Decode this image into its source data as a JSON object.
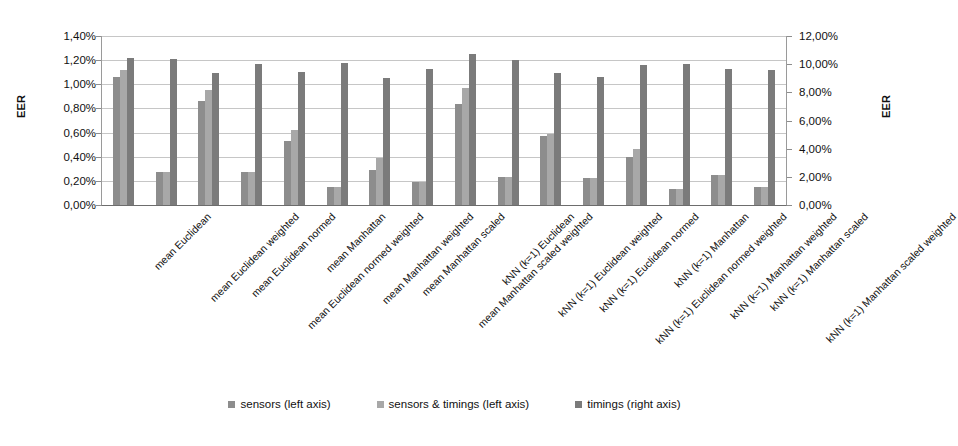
{
  "chart_data": {
    "type": "bar",
    "title": "",
    "xlabel": "",
    "ylabel": "EER",
    "ylabel_right": "EER",
    "grid": true,
    "legend_position": "bottom",
    "ylim": [
      0,
      1.4
    ],
    "ylim_right": [
      0,
      12
    ],
    "ytick_labels": [
      "1,40%",
      "1,20%",
      "1,00%",
      "0,80%",
      "0,60%",
      "0,40%",
      "0,20%",
      "0,00%"
    ],
    "ytick_values": [
      1.4,
      1.2,
      1.0,
      0.8,
      0.6,
      0.4,
      0.2,
      0.0
    ],
    "ytick_labels_right": [
      "12,00%",
      "10,00%",
      "8,00%",
      "6,00%",
      "4,00%",
      "2,00%",
      "0,00%"
    ],
    "ytick_values_right": [
      12,
      10,
      8,
      6,
      4,
      2,
      0
    ],
    "categories": [
      "mean Euclidean",
      "mean Euclidean weighted",
      "mean Euclidean normed",
      "mean Euclidean normed weighted",
      "mean Manhattan",
      "mean Manhattan weighted",
      "mean Manhattan scaled",
      "mean Manhattan scaled weighted",
      "kNN (k=1) Euclidean",
      "kNN (k=1) Euclidean weighted",
      "kNN (k=1) Euclidean normed",
      "kNN (k=1) Euclidean normed weighted",
      "kNN (k=1) Manhattan",
      "kNN (k=1) Manhattan weighted",
      "kNN (k=1) Manhattan scaled",
      "kNN (k=1) Manhattan scaled weighted"
    ],
    "series": [
      {
        "name": "sensors (left axis)",
        "axis": "left",
        "color": "#8d8d8d",
        "values": [
          1.06,
          0.27,
          0.86,
          0.27,
          0.53,
          0.15,
          0.29,
          0.19,
          0.84,
          0.23,
          0.57,
          0.22,
          0.4,
          0.13,
          0.25,
          0.15
        ]
      },
      {
        "name": "sensors & timings (left axis)",
        "axis": "left",
        "color": "#a8a8a8",
        "values": [
          1.12,
          0.27,
          0.95,
          0.27,
          0.62,
          0.15,
          0.39,
          0.19,
          0.97,
          0.23,
          0.59,
          0.22,
          0.46,
          0.13,
          0.25,
          0.15
        ]
      },
      {
        "name": "timings (right axis)",
        "axis": "right",
        "color": "#7b7b7b",
        "values_left_scale": [
          1.22,
          1.21,
          1.09,
          1.17,
          1.1,
          1.18,
          1.05,
          1.13,
          1.25,
          1.2,
          1.09,
          1.06,
          1.16,
          1.17,
          1.13,
          1.12
        ],
        "values": [
          10.46,
          10.37,
          9.34,
          10.03,
          9.43,
          10.11,
          9.0,
          9.69,
          10.71,
          10.29,
          9.34,
          9.09,
          9.94,
          10.03,
          9.69,
          9.6
        ]
      }
    ]
  },
  "legend": {
    "items": [
      {
        "label": "sensors (left axis)",
        "color": "#8d8d8d"
      },
      {
        "label": "sensors & timings (left axis)",
        "color": "#a8a8a8"
      },
      {
        "label": "timings (right axis)",
        "color": "#7b7b7b"
      }
    ]
  }
}
